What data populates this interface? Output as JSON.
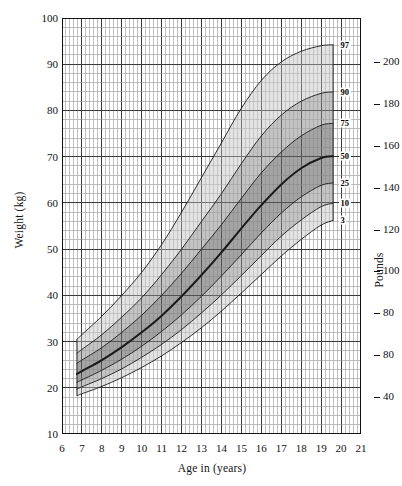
{
  "chart_data": {
    "type": "line",
    "title": "",
    "xlabel": "Age in (years)",
    "ylabel": "Weight (kg)",
    "y2label": "Pounds",
    "xlim": [
      6,
      21
    ],
    "ylim": [
      10,
      100
    ],
    "grid": true,
    "legend_position": "right-inline",
    "x_ticks": [
      "6",
      "7",
      "8",
      "9",
      "10",
      "11",
      "12",
      "13",
      "14",
      "15",
      "16",
      "17",
      "18",
      "19",
      "20",
      "21"
    ],
    "y_ticks": [
      "10",
      "20",
      "30",
      "40",
      "50",
      "60",
      "70",
      "80",
      "90",
      "100"
    ],
    "y2_ticks": [
      "40",
      "80",
      "80",
      "100",
      "120",
      "140",
      "160",
      "180",
      "200"
    ],
    "y2_tick_kg": [
      18.14,
      27.2,
      36.3,
      45.4,
      54.4,
      63.5,
      72.6,
      81.6,
      90.7
    ],
    "x": [
      6.75,
      7,
      8,
      9,
      10,
      11,
      12,
      13,
      14,
      15,
      16,
      17,
      18,
      19,
      19.6
    ],
    "series": [
      {
        "name": "97",
        "label": "97",
        "values": [
          30.5,
          31.5,
          35.5,
          40.0,
          45.0,
          51.0,
          58.0,
          65.5,
          73.0,
          80.5,
          86.5,
          90.5,
          92.8,
          94.0,
          94.2
        ]
      },
      {
        "name": "90",
        "label": "90",
        "values": [
          27.5,
          28.3,
          31.5,
          35.3,
          39.5,
          44.5,
          50.0,
          56.0,
          62.0,
          68.5,
          74.5,
          79.0,
          82.0,
          83.7,
          84.0
        ]
      },
      {
        "name": "75",
        "label": "75",
        "values": [
          25.3,
          26.0,
          28.7,
          32.0,
          35.7,
          40.0,
          44.8,
          50.0,
          55.3,
          61.0,
          66.5,
          71.0,
          74.5,
          76.8,
          77.2
        ]
      },
      {
        "name": "50",
        "label": "50",
        "values": [
          23.0,
          23.6,
          26.0,
          28.8,
          32.0,
          35.6,
          39.8,
          44.4,
          49.3,
          54.5,
          59.5,
          64.0,
          67.5,
          69.7,
          70.1
        ]
      },
      {
        "name": "25",
        "label": "25",
        "values": [
          21.2,
          21.7,
          23.8,
          26.2,
          29.0,
          32.2,
          35.8,
          39.8,
          44.2,
          48.8,
          53.5,
          57.8,
          61.3,
          63.8,
          64.3
        ]
      },
      {
        "name": "10",
        "label": "10",
        "values": [
          19.7,
          20.2,
          22.0,
          24.1,
          26.6,
          29.4,
          32.6,
          36.2,
          40.1,
          44.3,
          48.6,
          52.8,
          56.3,
          59.2,
          59.9
        ]
      },
      {
        "name": "3",
        "label": "3",
        "values": [
          18.3,
          18.7,
          20.3,
          22.2,
          24.4,
          26.9,
          29.8,
          33.0,
          36.6,
          40.5,
          44.5,
          48.5,
          52.1,
          55.2,
          56.2
        ]
      }
    ],
    "bands": [
      {
        "from": "3",
        "to": "97",
        "shade": "light"
      },
      {
        "from": "10",
        "to": "90",
        "shade": "medium"
      },
      {
        "from": "25",
        "to": "75",
        "shade": "dark"
      }
    ]
  },
  "axes": {
    "y_title": "Weight (kg)",
    "x_title": "Age in (years)",
    "y2_title": "Pounds"
  },
  "colors": {
    "ink": "#111111",
    "grid_minor": "#9a9a9a",
    "grid_major": "#3a3a3a",
    "band_light": "#d6d6d6",
    "band_medium": "#a8a8a8",
    "band_dark": "#7a7a7a",
    "curve": "#1a1a1a"
  }
}
